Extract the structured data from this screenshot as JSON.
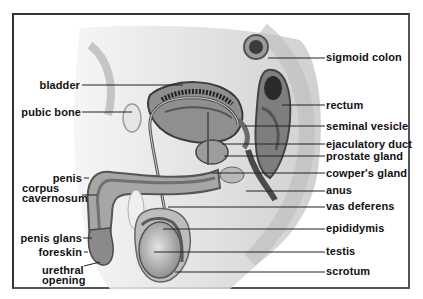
{
  "diagram": {
    "colors": {
      "frame": "#333333",
      "text": "#111111",
      "leader_line": "#222222",
      "illustration_tone": "#8c8c8c"
    },
    "left_labels": [
      {
        "id": "bladder",
        "text": "bladder"
      },
      {
        "id": "pubic-bone",
        "text": "pubic bone"
      },
      {
        "id": "penis",
        "text": "penis"
      },
      {
        "id": "corpus-cavernosum",
        "text": "corpus cavernosum",
        "lines": [
          "corpus",
          "cavernosum"
        ]
      },
      {
        "id": "penis-glans",
        "text": "penis glans"
      },
      {
        "id": "foreskin",
        "text": "foreskin"
      },
      {
        "id": "urethral-opening",
        "text": "urethral opening",
        "lines": [
          "urethral",
          "opening"
        ]
      }
    ],
    "right_labels": [
      {
        "id": "sigmoid-colon",
        "text": "sigmoid colon"
      },
      {
        "id": "rectum",
        "text": "rectum"
      },
      {
        "id": "seminal-vesicle",
        "text": "seminal vesicle"
      },
      {
        "id": "ejaculatory-duct",
        "text": "ejaculatory duct"
      },
      {
        "id": "prostate-gland",
        "text": "prostate gland"
      },
      {
        "id": "cowpers-gland",
        "text": "cowper's gland"
      },
      {
        "id": "anus",
        "text": "anus"
      },
      {
        "id": "vas-deferens",
        "text": "vas deferens"
      },
      {
        "id": "epididymis",
        "text": "epididymis"
      },
      {
        "id": "testis",
        "text": "testis"
      },
      {
        "id": "scrotum",
        "text": "scrotum"
      }
    ]
  }
}
